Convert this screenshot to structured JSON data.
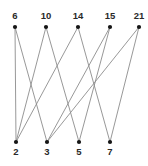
{
  "figure": {
    "background_color": "#ffffff",
    "edge_color": "#8c8c8c",
    "node_color": "#151515",
    "label_color": "#2a2a2a",
    "width": 148,
    "height": 166
  },
  "chart_data": {
    "type": "diagram",
    "subtype": "bipartite-graph",
    "title": "",
    "xlabel": "",
    "ylabel": "",
    "top_nodes": [
      {
        "id": "t0",
        "label": "6",
        "x": 15,
        "y": 27
      },
      {
        "id": "t1",
        "label": "10",
        "x": 46,
        "y": 27
      },
      {
        "id": "t2",
        "label": "14",
        "x": 78,
        "y": 27
      },
      {
        "id": "t3",
        "label": "15",
        "x": 110,
        "y": 27
      },
      {
        "id": "t4",
        "label": "21",
        "x": 139,
        "y": 27
      }
    ],
    "bottom_nodes": [
      {
        "id": "b0",
        "label": "2",
        "x": 16,
        "y": 142
      },
      {
        "id": "b1",
        "label": "3",
        "x": 47,
        "y": 142
      },
      {
        "id": "b2",
        "label": "5",
        "x": 79,
        "y": 142
      },
      {
        "id": "b3",
        "label": "7",
        "x": 110,
        "y": 142
      }
    ],
    "edges": [
      {
        "from": "6",
        "to": "2",
        "x1": 15,
        "y1": 27,
        "x2": 16,
        "y2": 142
      },
      {
        "from": "6",
        "to": "3",
        "x1": 15,
        "y1": 27,
        "x2": 47,
        "y2": 142
      },
      {
        "from": "10",
        "to": "2",
        "x1": 46,
        "y1": 27,
        "x2": 16,
        "y2": 142
      },
      {
        "from": "10",
        "to": "5",
        "x1": 46,
        "y1": 27,
        "x2": 79,
        "y2": 142
      },
      {
        "from": "14",
        "to": "2",
        "x1": 78,
        "y1": 27,
        "x2": 16,
        "y2": 142
      },
      {
        "from": "14",
        "to": "7",
        "x1": 78,
        "y1": 27,
        "x2": 110,
        "y2": 142
      },
      {
        "from": "15",
        "to": "3",
        "x1": 110,
        "y1": 27,
        "x2": 47,
        "y2": 142
      },
      {
        "from": "15",
        "to": "5",
        "x1": 110,
        "y1": 27,
        "x2": 79,
        "y2": 142
      },
      {
        "from": "21",
        "to": "3",
        "x1": 139,
        "y1": 27,
        "x2": 47,
        "y2": 142
      },
      {
        "from": "21",
        "to": "7",
        "x1": 139,
        "y1": 27,
        "x2": 110,
        "y2": 142
      }
    ],
    "top_label_offset_y": -8,
    "bottom_label_offset_y": 13,
    "node_radius": 2.1,
    "grid": false,
    "legend": null
  }
}
